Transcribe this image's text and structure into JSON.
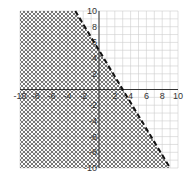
{
  "chart_data": {
    "type": "line",
    "title": "",
    "xlabel": "",
    "ylabel": "",
    "xlim": [
      -10,
      10
    ],
    "ylim": [
      -10,
      10
    ],
    "grid": true,
    "x_ticks": [
      -10,
      -8,
      -6,
      -4,
      -2,
      2,
      4,
      6,
      8,
      10
    ],
    "y_ticks": [
      10,
      8,
      6,
      4,
      2,
      -2,
      -4,
      -6,
      -8,
      -10
    ],
    "series": [
      {
        "name": "boundary line",
        "style": "dashed",
        "equation": "y = -5/3 x + 5",
        "x": [
          -3,
          9
        ],
        "y": [
          10,
          -10
        ]
      }
    ],
    "shaded_region": {
      "inequality": "y < -5/3 x + 5",
      "side": "below/left of line",
      "pattern": "crosshatch"
    }
  },
  "colors": {
    "grid": "#cccccc",
    "axis": "#333333",
    "line": "#111111",
    "hatch": "#555555"
  }
}
